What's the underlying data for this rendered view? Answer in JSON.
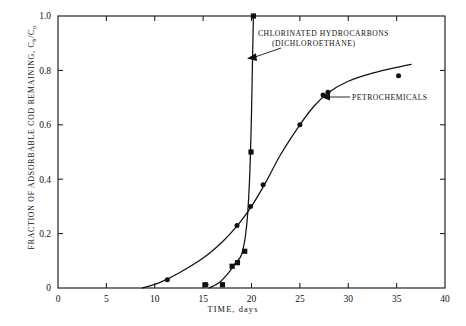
{
  "chart_data": {
    "type": "scatter",
    "title": "",
    "xlabel": "TIME, days",
    "ylabel": "FRACTION OF ADSORBABLE COD REMAINING, Cb/Co",
    "ylabel_main": "FRACTION OF ADSORBABLE COD REMAINING,  C",
    "ylabel_sub1": "b",
    "ylabel_mid": "/C",
    "ylabel_sub2": "o",
    "xlim": [
      0,
      40
    ],
    "ylim": [
      0,
      1.0
    ],
    "xticks": [
      0,
      5,
      10,
      15,
      20,
      25,
      30,
      35,
      40
    ],
    "xtick_labels": [
      "0",
      "5",
      "10",
      "15",
      "20",
      "25",
      "30",
      "35",
      "40"
    ],
    "yticks": [
      0,
      0.2,
      0.4,
      0.6,
      0.8,
      1.0
    ],
    "ytick_labels": [
      "0",
      "0.2",
      "0.4",
      "0.6",
      "0.8",
      "1.0"
    ],
    "grid": false,
    "legend_position": "inline-annotations",
    "series": [
      {
        "name": "CHLORINATED HYDROCARBONS (DICHLOROETHANE)",
        "marker": "square",
        "points": [
          {
            "x": 15.2,
            "y": 0.012
          },
          {
            "x": 17.0,
            "y": 0.012
          },
          {
            "x": 18.0,
            "y": 0.08
          },
          {
            "x": 18.55,
            "y": 0.093
          },
          {
            "x": 19.3,
            "y": 0.135
          },
          {
            "x": 19.95,
            "y": 0.5
          },
          {
            "x": 20.2,
            "y": 1.0
          }
        ],
        "curve": [
          {
            "x": 15.6,
            "y": 0.0
          },
          {
            "x": 16.6,
            "y": 0.018
          },
          {
            "x": 17.6,
            "y": 0.055
          },
          {
            "x": 18.3,
            "y": 0.09
          },
          {
            "x": 19.0,
            "y": 0.125
          },
          {
            "x": 19.5,
            "y": 0.23
          },
          {
            "x": 19.8,
            "y": 0.4
          },
          {
            "x": 20.0,
            "y": 0.64
          },
          {
            "x": 20.1,
            "y": 0.83
          },
          {
            "x": 20.2,
            "y": 1.0
          }
        ]
      },
      {
        "name": "PETROCHEMICALS",
        "marker": "circle",
        "points": [
          {
            "x": 11.3,
            "y": 0.03
          },
          {
            "x": 15.3,
            "y": 0.012
          },
          {
            "x": 18.5,
            "y": 0.23
          },
          {
            "x": 19.9,
            "y": 0.3
          },
          {
            "x": 21.2,
            "y": 0.38
          },
          {
            "x": 25.0,
            "y": 0.6
          },
          {
            "x": 27.4,
            "y": 0.71
          },
          {
            "x": 27.9,
            "y": 0.72
          },
          {
            "x": 35.2,
            "y": 0.78
          }
        ],
        "curve": [
          {
            "x": 8.7,
            "y": 0.0
          },
          {
            "x": 10.5,
            "y": 0.02
          },
          {
            "x": 12.5,
            "y": 0.055
          },
          {
            "x": 15.0,
            "y": 0.11
          },
          {
            "x": 17.0,
            "y": 0.17
          },
          {
            "x": 18.6,
            "y": 0.232
          },
          {
            "x": 20.0,
            "y": 0.3
          },
          {
            "x": 21.5,
            "y": 0.39
          },
          {
            "x": 23.0,
            "y": 0.49
          },
          {
            "x": 25.0,
            "y": 0.6
          },
          {
            "x": 26.5,
            "y": 0.67
          },
          {
            "x": 28.0,
            "y": 0.72
          },
          {
            "x": 30.0,
            "y": 0.76
          },
          {
            "x": 32.5,
            "y": 0.79
          },
          {
            "x": 35.5,
            "y": 0.815
          },
          {
            "x": 36.5,
            "y": 0.822
          }
        ]
      }
    ],
    "annotations": [
      {
        "id": "chlorinated",
        "line1": "CHLORINATED HYDROCARBONS",
        "line2": "(DICHLOROETHANE)"
      },
      {
        "id": "petrochemicals",
        "line1": "PETROCHEMICALS"
      }
    ]
  }
}
